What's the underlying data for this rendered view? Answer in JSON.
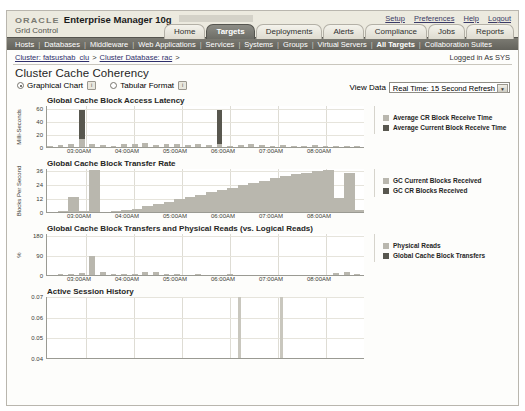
{
  "branding": {
    "oracle": "ORACLE",
    "product": "Enterprise Manager 10g",
    "edition": "Grid Control"
  },
  "util_links": [
    {
      "label": "Setup",
      "name": "setup-link"
    },
    {
      "label": "Preferences",
      "name": "preferences-link"
    },
    {
      "label": "Help",
      "name": "help-link"
    },
    {
      "label": "Logout",
      "name": "logout-link"
    }
  ],
  "tabs": [
    {
      "label": "Home",
      "active": false
    },
    {
      "label": "Targets",
      "active": true
    },
    {
      "label": "Deployments",
      "active": false
    },
    {
      "label": "Alerts",
      "active": false
    },
    {
      "label": "Compliance",
      "active": false
    },
    {
      "label": "Jobs",
      "active": false
    },
    {
      "label": "Reports",
      "active": false
    }
  ],
  "subnav": [
    {
      "label": "Hosts",
      "current": false
    },
    {
      "label": "Databases",
      "current": false
    },
    {
      "label": "Middleware",
      "current": false
    },
    {
      "label": "Web Applications",
      "current": false
    },
    {
      "label": "Services",
      "current": false
    },
    {
      "label": "Systems",
      "current": false
    },
    {
      "label": "Groups",
      "current": false
    },
    {
      "label": "Virtual Servers",
      "current": false
    },
    {
      "label": "All Targets",
      "current": true
    },
    {
      "label": "Collaboration Suites",
      "current": false
    }
  ],
  "breadcrumb": {
    "items": [
      {
        "label": "Cluster: fatsushab_clu"
      },
      {
        "label": "Cluster Database: rac"
      }
    ],
    "separator": ">",
    "logged_in": "Logged in As SYS"
  },
  "page_title": "Cluster Cache Coherency",
  "controls": {
    "graphical_chart_label": "Graphical Chart",
    "tabular_format_label": "Tabular Format",
    "graphical_selected": true,
    "info_icon_glyph": "i",
    "view_data_label": "View Data",
    "view_data_value": "Real Time: 15 Second Refresh",
    "view_data_arrow": "▼"
  },
  "colors": {
    "series_light": "#b9b7ae",
    "series_dark": "#58574f",
    "grid": "#dedcd4",
    "axis": "#9a9a93",
    "tab_active_bg": "#7a7a73",
    "subnav_bg": "#6f6e67"
  },
  "chart_data": [
    {
      "type": "line",
      "title": "Global Cache Block Access Latency",
      "ylabel": "Milli-Seconds",
      "xlabel": "",
      "yticks": [
        0,
        20,
        40,
        60
      ],
      "ylim": [
        0,
        65
      ],
      "xticks": [
        "03:00AM",
        "04:00AM",
        "05:00AM",
        "06:00AM",
        "07:00AM",
        "08:00AM"
      ],
      "grid": true,
      "legend_position": "right",
      "series": [
        {
          "name": "Average CR Block Receive Time",
          "color": "#b9b7ae",
          "values": [
            2,
            3,
            5,
            12,
            4,
            3,
            2,
            5,
            4,
            6,
            3,
            4,
            5,
            3,
            4,
            3,
            5,
            2,
            3,
            4,
            3,
            2,
            3,
            2,
            2,
            3,
            2,
            2,
            1,
            1
          ]
        },
        {
          "name": "Average Current Block Receive Time",
          "color": "#58574f",
          "values": [
            1,
            2,
            3,
            58,
            2,
            2,
            1,
            3,
            2,
            3,
            2,
            2,
            3,
            2,
            2,
            2,
            58,
            1,
            2,
            2,
            2,
            1,
            2,
            1,
            1,
            2,
            1,
            1,
            1,
            1
          ]
        }
      ]
    },
    {
      "type": "area",
      "title": "Global Cache Block Transfer Rate",
      "ylabel": "Blocks Per Second",
      "xlabel": "",
      "yticks": [
        0,
        12,
        24,
        36
      ],
      "ylim": [
        0,
        38
      ],
      "xticks": [
        "03:00AM",
        "04:00AM",
        "05:00AM",
        "06:00AM",
        "07:00AM",
        "08:00AM"
      ],
      "grid": true,
      "legend_position": "right",
      "series": [
        {
          "name": "GC Current Blocks Received",
          "color": "#b9b7ae",
          "values": [
            0,
            1,
            13,
            1,
            36,
            0,
            1,
            2,
            3,
            5,
            7,
            9,
            11,
            13,
            15,
            17,
            19,
            21,
            23,
            25,
            27,
            29,
            31,
            33,
            34,
            35,
            36,
            12,
            34,
            2
          ]
        },
        {
          "name": "GC CR Blocks Received",
          "color": "#58574f",
          "values": [
            0,
            0,
            2,
            0,
            4,
            0,
            0,
            1,
            1,
            1,
            2,
            2,
            2,
            3,
            3,
            3,
            4,
            4,
            4,
            5,
            5,
            5,
            6,
            6,
            6,
            7,
            7,
            3,
            8,
            1
          ]
        }
      ]
    },
    {
      "type": "line",
      "title": "Global Cache Block Transfers and Physical Reads (vs. Logical Reads)",
      "ylabel": "%",
      "xlabel": "",
      "yticks": [
        0,
        90,
        180
      ],
      "ylim": [
        0,
        190
      ],
      "xticks": [
        "03:00AM",
        "04:00AM",
        "05:00AM",
        "06:00AM",
        "07:00AM",
        "08:00AM"
      ],
      "grid": true,
      "legend_position": "right",
      "series": [
        {
          "name": "Physical Reads",
          "color": "#b9b7ae",
          "values": [
            2,
            4,
            6,
            10,
            88,
            12,
            6,
            4,
            3,
            14,
            12,
            4,
            3,
            2,
            3,
            2,
            2,
            3,
            2,
            2,
            2,
            2,
            2,
            2,
            2,
            2,
            2,
            8,
            14,
            3
          ]
        },
        {
          "name": "Global Cache Block Transfers",
          "color": "#58574f",
          "values": [
            1,
            2,
            3,
            5,
            40,
            6,
            3,
            2,
            2,
            7,
            6,
            2,
            2,
            1,
            2,
            1,
            1,
            2,
            1,
            1,
            1,
            1,
            1,
            1,
            1,
            1,
            1,
            4,
            7,
            2
          ]
        }
      ]
    },
    {
      "type": "bar",
      "title": "Active Session History",
      "ylabel": "",
      "xlabel": "",
      "yticks": [
        0.07,
        0.06,
        0.05,
        0.04
      ],
      "ylim": [
        0.04,
        0.07
      ],
      "xticks": [],
      "grid": true,
      "legend_position": "none",
      "series": [
        {
          "name": "Active Sessions",
          "color": "#c9c7be",
          "values": [
            0,
            0,
            0,
            0,
            0,
            0,
            0,
            0,
            0,
            0,
            0,
            0,
            0,
            0,
            0,
            0,
            0,
            0,
            0.07,
            0,
            0,
            0,
            0.07,
            0,
            0,
            0,
            0,
            0,
            0,
            0
          ]
        }
      ]
    }
  ]
}
